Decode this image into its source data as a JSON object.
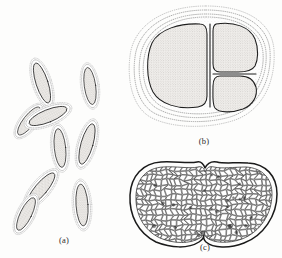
{
  "figure": {
    "background_color": "#fdfdfc",
    "ink_color": "#1d1d1d",
    "stipple_color": "#8e8e8e",
    "cytoplasm_fill": "#e3e1de",
    "capsule_fill": "#ffffff",
    "panels": [
      {
        "id": "a",
        "label": "(a)",
        "label_x": 64,
        "label_y": 243,
        "subject": "rod-shaped-encapsulated-bacilli",
        "cell_shape": "rod",
        "cell_count": 9,
        "capsule": "individual stippled capsule around each rod",
        "cells": [
          {
            "cx": 42,
            "cy": 83,
            "rx": 9.5,
            "ry": 26,
            "angle": -18
          },
          {
            "cx": 28,
            "cy": 120,
            "rx": 9.0,
            "ry": 21,
            "angle": 38
          },
          {
            "cx": 47,
            "cy": 116,
            "rx": 10.0,
            "ry": 25,
            "angle": 68
          },
          {
            "cx": 90,
            "cy": 86,
            "rx": 9.0,
            "ry": 23,
            "angle": -8
          },
          {
            "cx": 60,
            "cy": 148,
            "rx": 9.0,
            "ry": 24,
            "angle": -6
          },
          {
            "cx": 86,
            "cy": 143,
            "rx": 9.5,
            "ry": 26,
            "angle": 16
          },
          {
            "cx": 40,
            "cy": 188,
            "rx": 9.5,
            "ry": 25,
            "angle": 40
          },
          {
            "cx": 27,
            "cy": 213,
            "rx": 9.0,
            "ry": 22,
            "angle": 28
          },
          {
            "cx": 82,
            "cy": 205,
            "rx": 9.5,
            "ry": 26,
            "angle": -4
          }
        ]
      },
      {
        "id": "b",
        "label": "(b)",
        "label_x": 204,
        "label_y": 144,
        "subject": "encapsulated-cell-packet",
        "cell_shape": "coccoid-packet",
        "cell_count": 3,
        "capsule": "single shared multilayered stippled capsule",
        "capsule_layers": 4,
        "cells": [
          {
            "name": "left-cell",
            "cx": 172,
            "cy": 65
          },
          {
            "name": "upper-right-cell",
            "cx": 239,
            "cy": 42
          },
          {
            "name": "lower-right-cell",
            "cx": 239,
            "cy": 93
          }
        ]
      },
      {
        "id": "c",
        "label": "(c)",
        "label_x": 205,
        "label_y": 250,
        "subject": "bilobed-body-with-polygonal-cells",
        "cell_shape": "polygonal-reticulate",
        "outline": "double-walled bilobed capsule with median notch",
        "interior": "dense packing of small polygonal cells",
        "approx_cell_count": 420
      }
    ]
  }
}
